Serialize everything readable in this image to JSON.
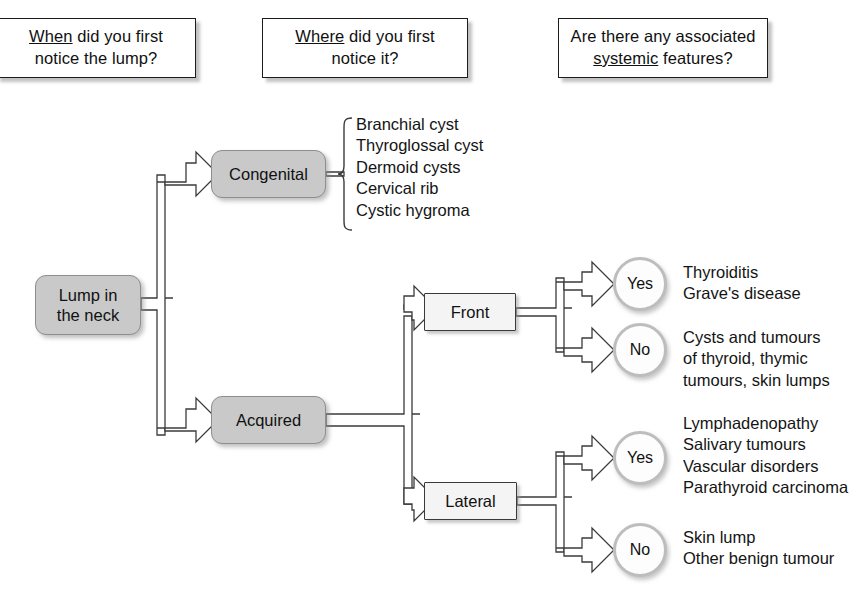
{
  "diagram": {
    "colors": {
      "node_gray_fill": "#c9c9c9",
      "node_white_fill": "#f4f4f4",
      "outline": "#3b3b3b",
      "circle_ring": "#bdbdbd",
      "text": "#141414",
      "background": "#ffffff"
    }
  },
  "headers": [
    {
      "id": "when",
      "line1_underlined": "When",
      "line1_rest": " did you first",
      "line2": "notice the lump?"
    },
    {
      "id": "where",
      "line1_underlined": "Where",
      "line1_rest": " did you first",
      "line2": "notice it?"
    },
    {
      "id": "systemic",
      "line1": "Are there any associated",
      "line2_underlined": "systemic",
      "line2_rest": " features?"
    }
  ],
  "nodes": {
    "root": "Lump in\nthe neck",
    "congenital": "Congenital",
    "acquired": "Acquired",
    "front": "Front",
    "lateral": "Lateral"
  },
  "circles": {
    "front_yes": "Yes",
    "front_no": "No",
    "lateral_yes": "Yes",
    "lateral_no": "No"
  },
  "outcomes": {
    "congenital_list": [
      "Branchial cyst",
      "Thyroglossal cyst",
      "Dermoid cysts",
      "Cervical rib",
      "Cystic hygroma"
    ],
    "front_yes_list": [
      "Thyroiditis",
      "Grave's disease"
    ],
    "front_no_list": [
      "Cysts and tumours",
      "of thyroid, thymic",
      "tumours, skin lumps"
    ],
    "lateral_yes_list": [
      "Lymphadenopathy",
      "Salivary tumours",
      "Vascular disorders",
      "Parathyroid carcinoma"
    ],
    "lateral_no_list": [
      "Skin lump",
      "Other benign tumour"
    ]
  }
}
